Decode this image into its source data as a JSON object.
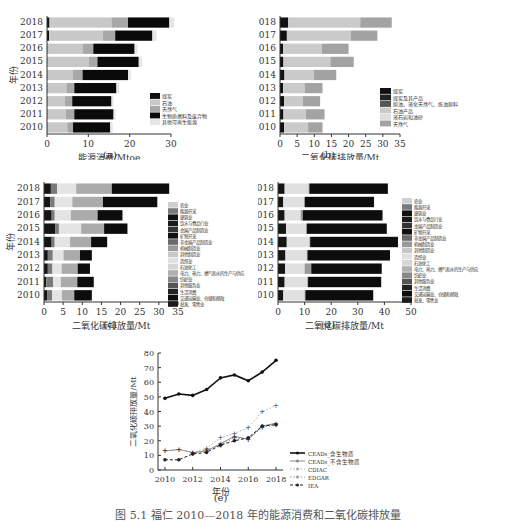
{
  "figure_caption": "图 5.1 福仁 2010—2018 年的能源消费和二氧化碳排放量",
  "chart_data": [
    {
      "id": "a",
      "panel_label": "(a)",
      "type": "bar",
      "orientation": "horizontal",
      "stacked": true,
      "title": "",
      "xlabel": "能源消费/Mtoe",
      "ylabel": "年份",
      "xlim": [
        0,
        30
      ],
      "xticks": [
        0,
        10,
        20,
        30
      ],
      "categories": [
        "2010",
        "2011",
        "2012",
        "2013",
        "2014",
        "2015",
        "2016",
        "2017",
        "2018"
      ],
      "legend": [
        "煤炭",
        "石油",
        "天然气",
        "生物质燃料及废弃物",
        "其他可再生能源"
      ],
      "series": [
        {
          "name": "煤炭",
          "color": "#111111",
          "values": [
            0.1,
            0.1,
            0.1,
            0.1,
            0.1,
            0.1,
            0.1,
            0.5,
            0.6
          ]
        },
        {
          "name": "石油",
          "color": "#c8c8c8",
          "values": [
            4.8,
            4.5,
            4.2,
            4.6,
            6.2,
            10.0,
            8.5,
            13.0,
            15.0
          ]
        },
        {
          "name": "天然气",
          "color": "#a8a8a8",
          "values": [
            1.4,
            2.0,
            1.8,
            1.9,
            2.3,
            2.1,
            2.6,
            3.0,
            4.0
          ]
        },
        {
          "name": "生物质燃料及废弃物",
          "color": "#0a0a0a",
          "values": [
            9.0,
            9.5,
            9.5,
            10.2,
            11.0,
            10.0,
            10.0,
            9.0,
            10.0
          ]
        },
        {
          "name": "其他可再生能源",
          "color": "#e6e6e6",
          "values": [
            0.6,
            0.5,
            0.5,
            0.6,
            0.7,
            0.8,
            0.7,
            1.0,
            1.2
          ]
        }
      ]
    },
    {
      "id": "b",
      "panel_label": "(b)",
      "type": "bar",
      "orientation": "horizontal",
      "stacked": true,
      "xlabel": "二氧化碳排放量/Mt",
      "ylabel": "年份",
      "xlim": [
        0,
        35
      ],
      "xticks": [
        0,
        5,
        10,
        15,
        20,
        25,
        30,
        35
      ],
      "categories": [
        "2010",
        "2011",
        "2012",
        "2013",
        "2014",
        "2015",
        "2016",
        "2017",
        "2018"
      ],
      "legend": [
        "煤炭",
        "煤炭及其产品",
        "原油、液化天然气、炼油原料",
        "石油产品",
        "液石岩和油砂",
        "天然气"
      ],
      "series": [
        {
          "name": "煤炭",
          "color": "#111111",
          "values": [
            1.2,
            1.0,
            1.2,
            0.9,
            1.3,
            1.0,
            0.9,
            2.0,
            2.4
          ]
        },
        {
          "name": "煤炭及其产品",
          "color": "#222222",
          "values": [
            0,
            0,
            0,
            0,
            0,
            0,
            0,
            0,
            0
          ]
        },
        {
          "name": "原油、液化天然气、炼油原料",
          "color": "#555555",
          "values": [
            0,
            0,
            0,
            0,
            0,
            0,
            0,
            0,
            0
          ]
        },
        {
          "name": "石油产品",
          "color": "#cacaca",
          "values": [
            7.0,
            6.5,
            5.5,
            6.3,
            8.6,
            13.7,
            11.3,
            18.6,
            21.0
          ]
        },
        {
          "name": "液石岩和油砂",
          "color": "#dedede",
          "values": [
            0,
            0,
            0,
            0,
            0,
            0,
            0,
            0,
            0
          ]
        },
        {
          "name": "天然气",
          "color": "#a3a3a3",
          "values": [
            4.2,
            5.5,
            5.0,
            5.2,
            6.5,
            6.8,
            7.8,
            7.8,
            9.2
          ]
        }
      ]
    },
    {
      "id": "c",
      "panel_label": "(c)",
      "type": "bar",
      "orientation": "horizontal",
      "stacked": true,
      "xlabel": "二氧化碳排放量/Mt",
      "ylabel": "年份",
      "xlim": [
        0,
        35
      ],
      "xticks": [
        0,
        5,
        10,
        15,
        20,
        25,
        30,
        35
      ],
      "categories": [
        "2010",
        "2011",
        "2012",
        "2013",
        "2014",
        "2015",
        "2016",
        "2017",
        "2018"
      ],
      "legend": [
        "农业",
        "能源开采",
        "建筑业",
        "饮水与食品行业",
        "金属产品制造业",
        "矿物开采",
        "非金属产品制造业",
        "机械制造业",
        "其他制造业",
        "造纸业",
        "石油化工",
        "电力、热力、燃气和水的生产与供应",
        "纺织业",
        "其他服务业",
        "生活消费",
        "交通运输业、仓储和邮政",
        "批发、零售业"
      ],
      "series": [
        {
          "name": "建筑业等",
          "color": "#151515",
          "values": [
            0.8,
            0.6,
            1.0,
            1.0,
            2.0,
            3.0,
            2.0,
            1.6,
            1.8
          ]
        },
        {
          "name": "能源开采等",
          "color": "#7a7a7a",
          "values": [
            1.3,
            1.8,
            1.2,
            1.3,
            0.8,
            0.9,
            0.8,
            1.2,
            1.6
          ]
        },
        {
          "name": "其他制造业/造纸业",
          "color": "#e4e4e4",
          "values": [
            2.6,
            2.0,
            2.4,
            2.8,
            4.0,
            5.8,
            4.2,
            4.6,
            5.0
          ]
        },
        {
          "name": "电力、热力、燃气和水的生产与供应",
          "color": "#ababab",
          "values": [
            3.2,
            4.3,
            4.2,
            4.3,
            5.5,
            6.0,
            7.0,
            8.0,
            9.3
          ]
        },
        {
          "name": "交通运输业、仓储和邮政",
          "color": "#0d0d0d",
          "values": [
            4.6,
            4.3,
            3.2,
            3.1,
            4.2,
            6.1,
            6.5,
            14.2,
            15.0
          ]
        }
      ]
    },
    {
      "id": "d",
      "panel_label": "(d)",
      "type": "bar",
      "orientation": "horizontal",
      "stacked": true,
      "xlabel": "二氧化碳排放量/Mt",
      "ylabel": "年份",
      "xlim": [
        0,
        50
      ],
      "xticks": [
        0,
        10,
        20,
        30,
        40,
        50
      ],
      "categories": [
        "2010",
        "2011",
        "2012",
        "2013",
        "2014",
        "2015",
        "2016",
        "2017",
        "2018"
      ],
      "legend": [
        "农业",
        "能源开采",
        "建筑业",
        "饮水与食品行业",
        "金属产品制造业",
        "矿物开采",
        "非金属产品制造业",
        "机械制造业",
        "其他制造业",
        "造纸业",
        "石油化工",
        "电力、热力、燃气和水的生产与供应",
        "纺织业",
        "其他服务业",
        "生活消费",
        "交通运输业、仓储和邮政",
        "批发、零售业"
      ],
      "series": [
        {
          "name": "建筑业等",
          "color": "#151515",
          "values": [
            2.0,
            2.5,
            2.7,
            2.8,
            3.3,
            3.0,
            2.5,
            2.0,
            2.5
          ]
        },
        {
          "name": "石油化工/造纸业",
          "color": "#e0e0e0",
          "values": [
            8.0,
            8.5,
            7.3,
            8.0,
            8.5,
            7.5,
            6.0,
            7.8,
            9.0
          ]
        },
        {
          "name": "电力、热力等",
          "color": "#9a9a9a",
          "values": [
            0.3,
            0.3,
            2.5,
            0.3,
            0.3,
            0.4,
            0.8,
            0.3,
            0.3
          ]
        },
        {
          "name": "交通运输业等",
          "color": "#0d0d0d",
          "values": [
            25.5,
            27.5,
            26.5,
            31.0,
            33.0,
            30.0,
            30.0,
            26.0,
            29.5
          ]
        }
      ]
    },
    {
      "id": "e",
      "panel_label": "(e)",
      "type": "line",
      "xlabel": "年份",
      "ylabel": "二氧化碳排放量/Mt",
      "xlim": [
        2009.5,
        2018.5
      ],
      "ylim": [
        0,
        80
      ],
      "xticks": [
        2010,
        2012,
        2014,
        2016,
        2018
      ],
      "yticks": [
        0,
        10,
        20,
        30,
        40,
        50,
        60,
        70,
        80
      ],
      "x": [
        2010,
        2011,
        2012,
        2013,
        2014,
        2015,
        2016,
        2017,
        2018
      ],
      "legend_position": "right",
      "series": [
        {
          "name": "CEADs_含生物质",
          "color": "#111111",
          "style": "solid",
          "marker": "circle",
          "values": [
            49,
            52,
            51,
            55,
            63,
            65,
            61,
            67,
            75
          ]
        },
        {
          "name": "CEADs_不含生物质",
          "color": "#888888",
          "style": "solid",
          "marker": "plus",
          "values": [
            13,
            14,
            12,
            13,
            18,
            23,
            21,
            30,
            32
          ]
        },
        {
          "name": "CDIAC",
          "color": "#aaaaaa",
          "style": "dotted",
          "marker": "plus",
          "values": [
            13,
            14,
            12,
            15,
            22,
            25,
            29,
            40,
            44
          ]
        },
        {
          "name": "EDGAR",
          "color": "#999999",
          "style": "dotted",
          "marker": "plus",
          "values": [
            null,
            null,
            11,
            14,
            17,
            22,
            21,
            29,
            31
          ]
        },
        {
          "name": "IEA",
          "color": "#222222",
          "style": "dashed",
          "marker": "star",
          "values": [
            7,
            7,
            11,
            12,
            17,
            20,
            22,
            30,
            31
          ]
        }
      ]
    }
  ]
}
